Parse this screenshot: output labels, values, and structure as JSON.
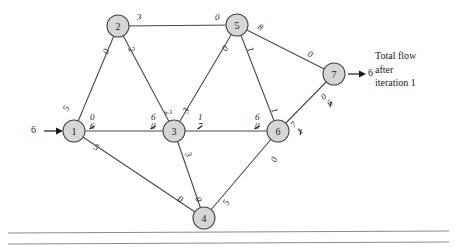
{
  "figure": {
    "type": "network-flow-diagram",
    "caption_lines": [
      "Total flow",
      "after",
      "iteration 1"
    ],
    "source_inflow": "6",
    "sink_outflow": "6"
  },
  "nodes": [
    {
      "id": "1",
      "label": "1",
      "cx": 74,
      "cy": 131
    },
    {
      "id": "2",
      "label": "2",
      "cx": 118,
      "cy": 26
    },
    {
      "id": "3",
      "label": "3",
      "cx": 174,
      "cy": 131
    },
    {
      "id": "4",
      "label": "4",
      "cx": 204,
      "cy": 218
    },
    {
      "id": "5",
      "label": "5",
      "cx": 237,
      "cy": 25
    },
    {
      "id": "6",
      "label": "6",
      "cx": 278,
      "cy": 131
    },
    {
      "id": "7",
      "label": "7",
      "cx": 334,
      "cy": 74
    }
  ],
  "edges": [
    {
      "from": "1",
      "to": "2"
    },
    {
      "from": "1",
      "to": "3"
    },
    {
      "from": "1",
      "to": "4"
    },
    {
      "from": "2",
      "to": "5"
    },
    {
      "from": "2",
      "to": "3"
    },
    {
      "from": "3",
      "to": "5"
    },
    {
      "from": "3",
      "to": "6"
    },
    {
      "from": "3",
      "to": "4"
    },
    {
      "from": "5",
      "to": "6"
    },
    {
      "from": "5",
      "to": "7"
    },
    {
      "from": "4",
      "to": "6"
    },
    {
      "from": "6",
      "to": "7"
    }
  ],
  "edge_labels": [
    {
      "name": "label-1-2-at-1",
      "x": 64,
      "y": 104,
      "rot": -62,
      "value": "5"
    },
    {
      "name": "label-1-2-at-2",
      "x": 104,
      "y": 47,
      "rot": -62,
      "value": "0"
    },
    {
      "name": "label-2-5-at-2",
      "x": 137,
      "y": 13,
      "rot": 0,
      "value": "3"
    },
    {
      "name": "label-2-5-at-5",
      "x": 215,
      "y": 13,
      "rot": 0,
      "value": "0"
    },
    {
      "name": "label-2-3-at-2",
      "x": 129,
      "y": 45,
      "rot": 62,
      "value": "2"
    },
    {
      "name": "label-2-3-at-3",
      "x": 166,
      "y": 108,
      "rot": 62,
      "value": "2"
    },
    {
      "name": "label-1-3-at-1",
      "x": 90,
      "y": 113,
      "rot": 0,
      "new": "0",
      "old": "6"
    },
    {
      "name": "label-1-3-at-3",
      "x": 151,
      "y": 113,
      "rot": 0,
      "new": "6",
      "old": "0"
    },
    {
      "name": "label-1-4-at-1",
      "x": 94,
      "y": 143,
      "rot": 27,
      "value": "5"
    },
    {
      "name": "label-1-4-at-4",
      "x": 178,
      "y": 195,
      "rot": 27,
      "value": "0"
    },
    {
      "name": "label-3-5-at-3",
      "x": 184,
      "y": 106,
      "rot": -62,
      "value": "3"
    },
    {
      "name": "label-3-5-at-5",
      "x": 223,
      "y": 44,
      "rot": -62,
      "value": "0"
    },
    {
      "name": "label-3-4-at-3",
      "x": 186,
      "y": 150,
      "rot": 66,
      "value": "3"
    },
    {
      "name": "label-3-4-at-4",
      "x": 196,
      "y": 195,
      "rot": 66,
      "value": "0"
    },
    {
      "name": "label-3-6-at-3",
      "x": 198,
      "y": 113,
      "rot": 0,
      "new": "1",
      "old": "7"
    },
    {
      "name": "label-3-6-at-6",
      "x": 255,
      "y": 113,
      "rot": 0,
      "new": "6",
      "old": "0"
    },
    {
      "name": "label-5-6-at-5",
      "x": 248,
      "y": 45,
      "rot": 66,
      "value": "1"
    },
    {
      "name": "label-5-6-at-6",
      "x": 272,
      "y": 106,
      "rot": 66,
      "value": "1"
    },
    {
      "name": "label-5-7-at-5",
      "x": 258,
      "y": 23,
      "rot": 30,
      "value": "8"
    },
    {
      "name": "label-5-7-at-7",
      "x": 308,
      "y": 50,
      "rot": 30,
      "value": "0"
    },
    {
      "name": "label-4-6-at-4",
      "x": 224,
      "y": 198,
      "rot": -62,
      "value": "5"
    },
    {
      "name": "label-4-6-at-6",
      "x": 272,
      "y": 155,
      "rot": -62,
      "value": "0"
    },
    {
      "name": "label-6-7-at-6",
      "x": 295,
      "y": 119,
      "rot": -45,
      "new": "7",
      "old": "1"
    },
    {
      "name": "label-6-7-at-7",
      "x": 325,
      "y": 91,
      "rot": -45,
      "new": "0",
      "old": "6"
    }
  ]
}
